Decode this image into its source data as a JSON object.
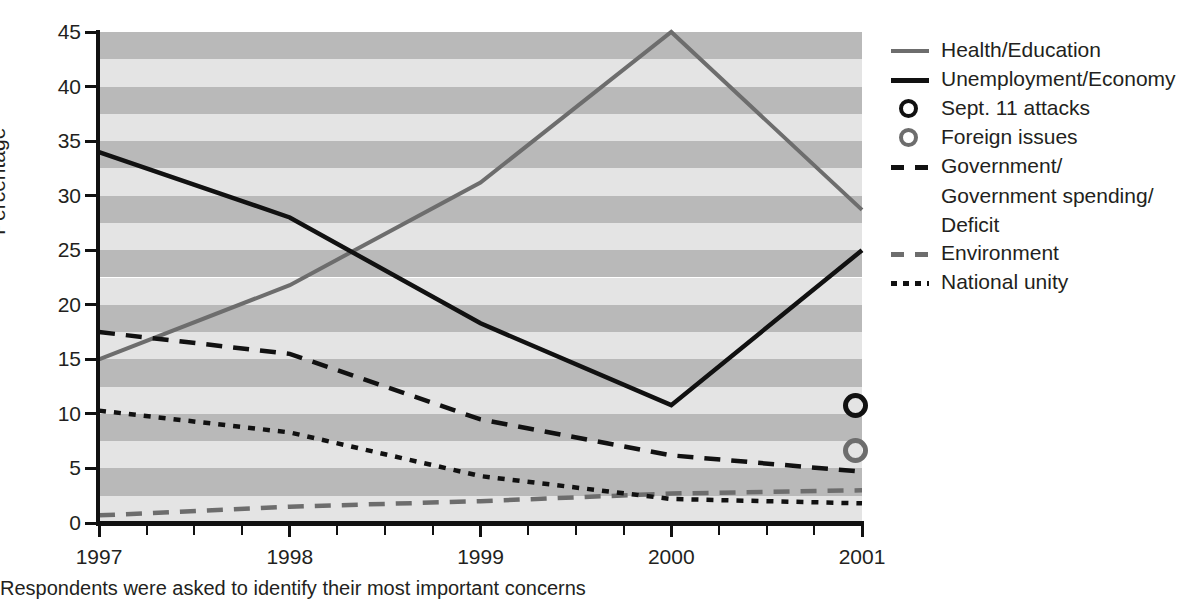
{
  "chart_data": {
    "type": "line",
    "title": "",
    "xlabel": "",
    "ylabel": "Percentage",
    "x": [
      1997,
      1998,
      1999,
      2000,
      2001
    ],
    "xtick_labels": [
      "1997",
      "1998",
      "1999",
      "2000",
      "2001"
    ],
    "xlim": [
      1997,
      2001
    ],
    "ylim": [
      0,
      45
    ],
    "ytick_labels": [
      "0",
      "5",
      "10",
      "15",
      "20",
      "25",
      "30",
      "35",
      "40",
      "45"
    ],
    "ytick_values": [
      0,
      5,
      10,
      15,
      20,
      25,
      30,
      35,
      40,
      45
    ],
    "grid": "horizontal-alternating-bands",
    "legend_position": "right",
    "minor_ticks_per_interval": 4,
    "series": [
      {
        "name": "Health/Education",
        "style": "solid",
        "color": "#6d6d6d",
        "width": 4,
        "values": [
          15.0,
          21.8,
          31.2,
          45.0,
          28.7
        ]
      },
      {
        "name": "Unemployment/Economy",
        "style": "solid",
        "color": "#111111",
        "width": 4.5,
        "values": [
          34.0,
          28.0,
          18.3,
          10.8,
          25.0
        ]
      },
      {
        "name": "Government/ Government spending/ Deficit",
        "style": "dashed",
        "color": "#111111",
        "width": 4.5,
        "values": [
          17.5,
          15.5,
          9.5,
          6.2,
          4.7
        ]
      },
      {
        "name": "Environment",
        "style": "dashed",
        "color": "#6d6d6d",
        "width": 4.5,
        "values": [
          0.7,
          1.5,
          2.0,
          2.7,
          3.0
        ]
      },
      {
        "name": "National unity",
        "style": "dotted",
        "color": "#111111",
        "width": 4.5,
        "values": [
          10.3,
          8.3,
          4.3,
          2.2,
          1.8
        ]
      }
    ],
    "points": [
      {
        "name": "Sept. 11 attacks",
        "color": "#111111",
        "x": 2001,
        "value": 10.8
      },
      {
        "name": "Foreign issues",
        "color": "#6d6d6d",
        "x": 2001,
        "value": 6.6
      }
    ],
    "band_colors": [
      "#b9b9b9",
      "#e4e4e4"
    ],
    "band_step": 2.5
  },
  "legend": {
    "items": [
      {
        "label": "Health/Education",
        "marker": "line-solid",
        "color": "#6d6d6d",
        "thickness": 4
      },
      {
        "label": "Unemployment/Economy",
        "marker": "line-solid",
        "color": "#111111",
        "thickness": 5
      },
      {
        "label": "Sept. 11 attacks",
        "marker": "ring",
        "color": "#111111",
        "thickness": 4
      },
      {
        "label": "Foreign issues",
        "marker": "ring",
        "color": "#6d6d6d",
        "thickness": 4
      },
      {
        "label": "Government/",
        "marker": "line-dashed",
        "color": "#111111",
        "thickness": 5,
        "continuation": [
          "Government spending/",
          "Deficit"
        ]
      },
      {
        "label": "Environment",
        "marker": "line-dashed",
        "color": "#6d6d6d",
        "thickness": 5
      },
      {
        "label": "National unity",
        "marker": "line-dotted",
        "color": "#111111",
        "thickness": 5
      }
    ]
  },
  "caption": "Respondents were asked to identify their most important concerns"
}
